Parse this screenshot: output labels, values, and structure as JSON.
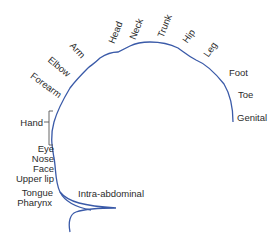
{
  "diagram": {
    "type": "homunculus-map",
    "curve_color": "#3a5aa8",
    "text_color": "#2b2b2b",
    "labels": {
      "head": "Head",
      "neck": "Neck",
      "trunk": "Trunk",
      "hip": "Hip",
      "leg": "Leg",
      "foot": "Foot",
      "toe": "Toe",
      "genital": "Genital",
      "arm": "Arm",
      "elbow": "Elbow",
      "forearm": "Forearm",
      "hand": "Hand",
      "eye": "Eye",
      "nose": "Nose",
      "face": "Face",
      "upper_lip": "Upper lip",
      "tongue": "Tongue",
      "pharynx": "Pharynx",
      "intra_abdominal": "Intra-abdominal"
    }
  }
}
